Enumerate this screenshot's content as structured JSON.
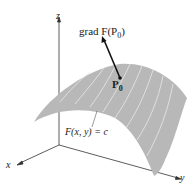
{
  "diagram": {
    "gradient_label_prefix": "grad F(P",
    "gradient_label_sub": "0",
    "gradient_label_suffix": ")",
    "point_label": "P",
    "point_label_sub": "0",
    "surface_label": "F(x, y) = c",
    "axes": {
      "x": "x",
      "y": "y",
      "z": "z"
    },
    "colors": {
      "surface": "#b8b8b8",
      "surface_lines": "#e6e6e6",
      "axis": "#333333",
      "vector": "#111111"
    }
  }
}
